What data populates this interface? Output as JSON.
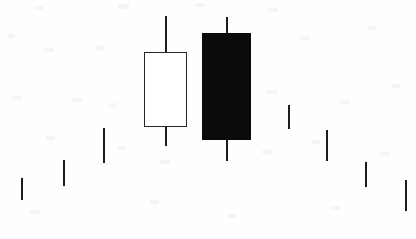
{
  "chart_data": {
    "type": "bar",
    "chart_kind": "candlestick",
    "title": "",
    "subtitle": "",
    "xlabel": "",
    "ylabel": "",
    "grid": false,
    "legend": "none",
    "axis_visible": false,
    "background_color": "#fefefe",
    "bullish_body_color": "#ffffff",
    "bearish_body_color": "#0b0b0b",
    "outline_color": "#262626",
    "wick_color": "#1c1c1c",
    "note": "Bearish engulfing pattern: a tall white (bullish) candle followed by a larger black (bearish) candle whose body engulfs it. Surrounding sessions are drawn as small price marks only.",
    "ylim": [
      0,
      239
    ],
    "xlim": [
      0,
      416
    ],
    "categories": [
      "1",
      "2",
      "3",
      "4",
      "5",
      "6",
      "7",
      "8",
      "9",
      "10"
    ],
    "series": [
      {
        "name": "price",
        "points": [
          {
            "label": "1",
            "kind": "mark",
            "x": 21,
            "top": 178,
            "bottom": 200,
            "body_top": null,
            "body_bottom": null,
            "color": "#2a2a2a",
            "width": 2
          },
          {
            "label": "2",
            "kind": "mark",
            "x": 63,
            "top": 160,
            "bottom": 186,
            "body_top": null,
            "body_bottom": null,
            "color": "#2a2a2a",
            "width": 2
          },
          {
            "label": "3",
            "kind": "mark",
            "x": 103,
            "top": 128,
            "bottom": 163,
            "body_top": null,
            "body_bottom": null,
            "color": "#2a2a2a",
            "width": 2
          },
          {
            "label": "4",
            "kind": "bullish",
            "x": 165,
            "top": 16,
            "bottom": 146,
            "body_top": 52,
            "body_bottom": 127,
            "body_left": 144,
            "body_right": 187,
            "color": "#ffffff",
            "width": 2
          },
          {
            "label": "5",
            "kind": "bearish",
            "x": 226,
            "top": 17,
            "bottom": 161,
            "body_top": 33,
            "body_bottom": 140,
            "body_left": 202,
            "body_right": 251,
            "color": "#0b0b0b",
            "width": 2
          },
          {
            "label": "6",
            "kind": "mark",
            "x": 288,
            "top": 105,
            "bottom": 129,
            "body_top": null,
            "body_bottom": null,
            "color": "#2a2a2a",
            "width": 2
          },
          {
            "label": "7",
            "kind": "mark",
            "x": 326,
            "top": 130,
            "bottom": 161,
            "body_top": null,
            "body_bottom": null,
            "color": "#2a2a2a",
            "width": 2
          },
          {
            "label": "8",
            "kind": "mark",
            "x": 365,
            "top": 162,
            "bottom": 187,
            "body_top": null,
            "body_bottom": null,
            "color": "#2a2a2a",
            "width": 2
          },
          {
            "label": "9",
            "kind": "mark",
            "x": 405,
            "top": 180,
            "bottom": 211,
            "body_top": null,
            "body_bottom": null,
            "color": "#2a2a2a",
            "width": 2
          }
        ]
      }
    ]
  }
}
